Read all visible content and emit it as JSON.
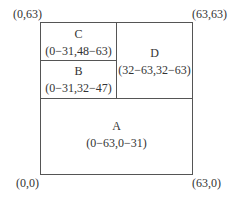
{
  "corners": {
    "top_left": "(0,63)",
    "top_right": "(63,63)",
    "bottom_left": "(0,0)",
    "bottom_right": "(63,0)"
  },
  "regions": {
    "C": {
      "name": "C",
      "range": "(0−31,48−63)"
    },
    "B": {
      "name": "B",
      "range": "(0−31,32−47)"
    },
    "D": {
      "name": "D",
      "range": "(32−63,32−63)"
    },
    "A": {
      "name": "A",
      "range": "(0−63,0−31)"
    }
  }
}
